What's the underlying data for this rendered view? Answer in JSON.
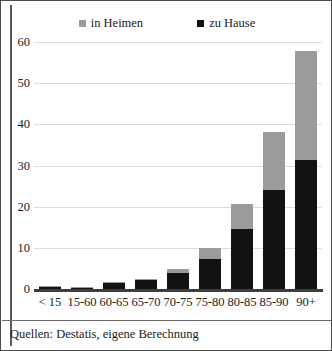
{
  "legend": {
    "entries": [
      {
        "label": "in Heimen",
        "color": "#9b9b9b"
      },
      {
        "label": "zu Hause",
        "color": "#121212"
      }
    ]
  },
  "footer": {
    "source_note": "Quellen: Destatis, eigene Berechnung"
  },
  "axis": {
    "y_ticks": [
      "0",
      "10",
      "20",
      "30",
      "40",
      "50",
      "60"
    ]
  },
  "chart_data": {
    "type": "bar",
    "stacked": true,
    "title": "",
    "xlabel": "",
    "ylabel": "",
    "ylim": [
      0,
      60
    ],
    "ytick_values": [
      0,
      10,
      20,
      30,
      40,
      50,
      60
    ],
    "grid": true,
    "legend_position": "top",
    "categories": [
      "< 15",
      "15-60",
      "60-65",
      "65-70",
      "70-75",
      "75-80",
      "80-85",
      "85-90",
      "90+"
    ],
    "series": [
      {
        "name": "zu Hause",
        "color": "#121212",
        "values": [
          0.4,
          0.3,
          1.4,
          2.2,
          3.9,
          7.3,
          14.6,
          24.0,
          31.3
        ]
      },
      {
        "name": "in Heimen",
        "color": "#9b9b9b",
        "values": [
          0.1,
          0.1,
          0.2,
          0.3,
          1.0,
          2.7,
          6.0,
          14.1,
          26.5
        ]
      }
    ],
    "totals": [
      0.5,
      0.4,
      1.6,
      2.5,
      4.9,
      10.0,
      20.6,
      38.1,
      57.8
    ]
  }
}
